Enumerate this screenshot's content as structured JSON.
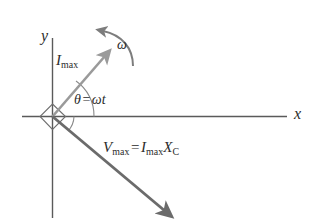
{
  "figure": {
    "type": "phasor-diagram",
    "axes": {
      "x_label": "x",
      "y_label": "y",
      "x_axis": {
        "x1": 22,
        "y1": 116,
        "x2": 287,
        "y2": 116
      },
      "y_axis": {
        "x1": 52,
        "y1": 38,
        "x2": 52,
        "y2": 218
      },
      "origin": {
        "x": 52,
        "y": 116
      }
    },
    "vectors": [
      {
        "name": "current-phasor",
        "label": "I",
        "label_sub": "max",
        "angle_deg": 55,
        "color": "#9a9a9a",
        "from": {
          "x": 52,
          "y": 116
        },
        "to": {
          "x": 107,
          "y": 54
        }
      },
      {
        "name": "voltage-phasor",
        "label": "V",
        "label_sub": "max",
        "angle_deg": -45,
        "color": "#6b6b6b",
        "from": {
          "x": 52,
          "y": 116
        },
        "to": {
          "x": 168,
          "y": 214
        }
      }
    ],
    "angle_annotation": {
      "theta": "θ",
      "equals": "=",
      "omega": "ω",
      "t": "t",
      "text": "θ = ωt"
    },
    "rotation_marker": {
      "label": "ω",
      "direction": "counterclockwise"
    },
    "equation": {
      "lhs": "V",
      "lhs_sub": "max",
      "operator": "=",
      "rhs_first": "I",
      "rhs_first_sub": "max",
      "rhs_second": "X",
      "rhs_second_sub": "C",
      "text": "V_max = I_max X_C"
    },
    "colors": {
      "axis": "#5a5a5a",
      "current_vector": "#9a9a9a",
      "voltage_vector": "#6b6b6b",
      "arc": "#8a8a8a",
      "text": "#2b2b2b",
      "background": "#ffffff"
    }
  }
}
